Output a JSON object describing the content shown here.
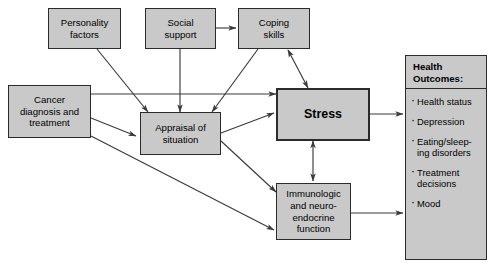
{
  "diagram": {
    "colors": {
      "box_fill": "#c9c9c9",
      "box_border": "#2b2b2b",
      "background": "#ffffff",
      "arrow": "#3a3a3a"
    },
    "nodes": [
      {
        "id": "personality",
        "label": "Personality\nfactors"
      },
      {
        "id": "social",
        "label": "Social\nsupport"
      },
      {
        "id": "coping",
        "label": "Coping\nskills"
      },
      {
        "id": "cancer",
        "label": "Cancer\ndiagnosis and\ntreatment"
      },
      {
        "id": "appraisal",
        "label": "Appraisal of\nsituation"
      },
      {
        "id": "stress",
        "label": "Stress"
      },
      {
        "id": "immuno",
        "label": "Immunologic\nand neuro-\nendocrine\nfunction"
      }
    ],
    "outcomes": {
      "heading": "Health\nOutcomes:",
      "items": [
        "Health status",
        "Depression",
        "Eating/sleep-\ning disorders",
        "Treatment\ndecisions",
        "Mood"
      ]
    },
    "edges": [
      {
        "from": "social",
        "to": "coping",
        "direction": "one-way"
      },
      {
        "from": "personality",
        "to": "appraisal",
        "direction": "one-way"
      },
      {
        "from": "social",
        "to": "appraisal",
        "direction": "one-way"
      },
      {
        "from": "coping",
        "to": "appraisal",
        "direction": "one-way"
      },
      {
        "from": "coping",
        "to": "stress",
        "direction": "two-way"
      },
      {
        "from": "cancer",
        "to": "stress",
        "direction": "one-way"
      },
      {
        "from": "cancer",
        "to": "appraisal",
        "direction": "one-way"
      },
      {
        "from": "cancer",
        "to": "immuno",
        "direction": "one-way"
      },
      {
        "from": "appraisal",
        "to": "stress",
        "direction": "one-way"
      },
      {
        "from": "appraisal",
        "to": "immuno",
        "direction": "one-way"
      },
      {
        "from": "stress",
        "to": "immuno",
        "direction": "two-way"
      },
      {
        "from": "stress",
        "to": "outcomes",
        "direction": "one-way"
      },
      {
        "from": "immuno",
        "to": "outcomes",
        "direction": "one-way"
      }
    ]
  }
}
